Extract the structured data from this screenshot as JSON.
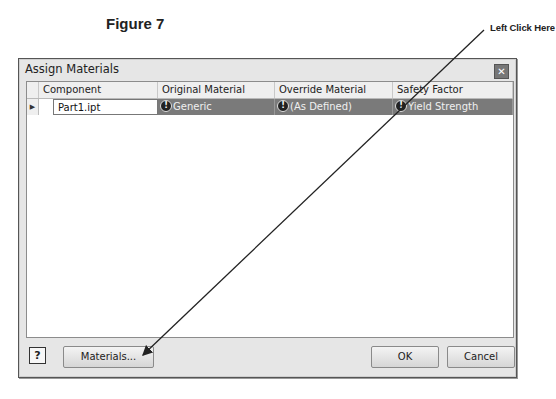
{
  "figure": {
    "title": "Figure 7",
    "callout": "Left Click Here"
  },
  "dialog": {
    "title": "Assign Materials",
    "close_icon": "close-icon",
    "grid": {
      "columns": [
        "Component",
        "Original Material",
        "Override Material",
        "Safety Factor"
      ],
      "rows": [
        {
          "row_marker": "▶",
          "component": "Part1.ipt",
          "original_material": "Generic",
          "override_material": "(As Defined)",
          "safety_factor": "Yield Strength",
          "status_icon": "warning-icon"
        }
      ]
    },
    "footer": {
      "help_icon": "?",
      "materials_label": "Materials...",
      "ok_label": "OK",
      "cancel_label": "Cancel"
    }
  },
  "colors": {
    "selected_cell_bg": "#7a7a7a",
    "dialog_bg": "#e6e6e6",
    "header_bg": "#efefef"
  }
}
